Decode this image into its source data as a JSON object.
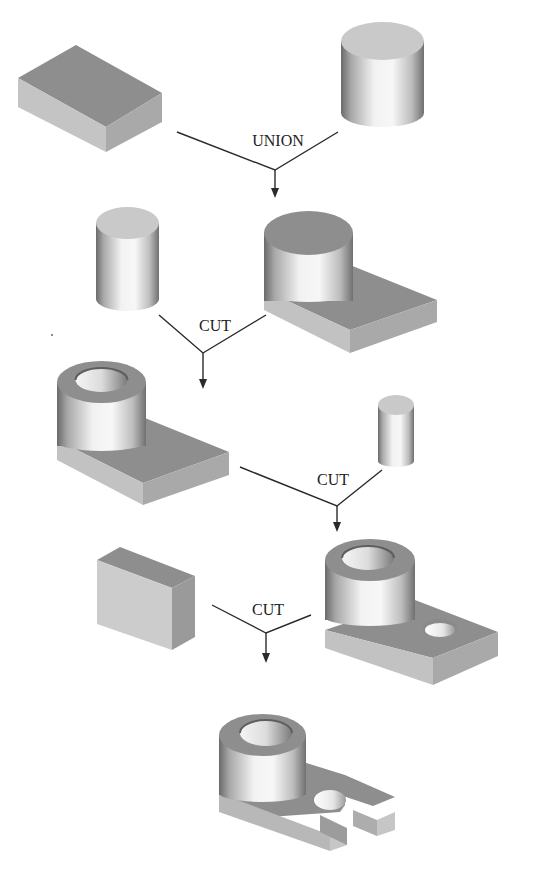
{
  "diagram": {
    "title": "",
    "type": "constructive-solid-geometry-sequence",
    "colors": {
      "background": "#ffffff",
      "top_face_dark": "#8e8e8e",
      "top_face_light": "#c9c9c9",
      "side_face_light": "#c2c2c2",
      "side_face_mid": "#a9a9a9",
      "cylinder_highlight": "#f4f4f4",
      "cylinder_shadow": "#6a6a6a",
      "line": "#2a2a2a"
    },
    "steps": [
      {
        "id": "step-1",
        "operation": "UNION",
        "operands": [
          "rectangular block",
          "cylinder"
        ],
        "result": "block with cylinder boss"
      },
      {
        "id": "step-2",
        "operation": "CUT",
        "operands": [
          "cylinder",
          "block with cylinder boss"
        ],
        "result": "block with hollow boss"
      },
      {
        "id": "step-3",
        "operation": "CUT",
        "operands": [
          "block with hollow boss",
          "small cylinder"
        ],
        "result": "block with hollow boss and hole"
      },
      {
        "id": "step-4",
        "operation": "CUT",
        "operands": [
          "rectangular block",
          "block with hollow boss and hole"
        ],
        "result": "final slotted part"
      }
    ],
    "labels": {
      "op1": "UNION",
      "op2": "CUT",
      "op3": "CUT",
      "op4": "CUT"
    },
    "shapes": [
      {
        "name": "box-primitive-1",
        "label": "rectangular block"
      },
      {
        "name": "cylinder-primitive-1",
        "label": "cylinder"
      },
      {
        "name": "cylinder-primitive-2",
        "label": "cylinder"
      },
      {
        "name": "union-result",
        "label": "block with cylinder boss"
      },
      {
        "name": "cut1-result",
        "label": "block with hollow boss"
      },
      {
        "name": "cylinder-primitive-small",
        "label": "small cylinder"
      },
      {
        "name": "box-primitive-2",
        "label": "rectangular block"
      },
      {
        "name": "cut2-result",
        "label": "block with hollow boss and hole"
      },
      {
        "name": "final-result",
        "label": "final slotted part"
      }
    ]
  }
}
